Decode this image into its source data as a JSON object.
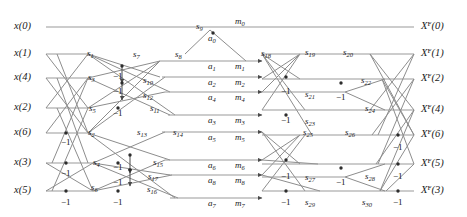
{
  "figure": {
    "type": "signal-flow-graph",
    "colors": {
      "line": "#8a8a8a",
      "text": "#1a1a1a",
      "background": "#ffffff"
    }
  },
  "inputs": [
    {
      "id": "x0",
      "text": "x(0)",
      "base": "x",
      "index": "(0)",
      "y": 27
    },
    {
      "id": "x1",
      "text": "x(1)",
      "base": "x",
      "index": "(1)",
      "y": 54
    },
    {
      "id": "x4",
      "text": "x(4)",
      "base": "x",
      "index": "(4)",
      "y": 78
    },
    {
      "id": "x2",
      "text": "x(2)",
      "base": "x",
      "index": "(2)",
      "y": 108
    },
    {
      "id": "x6",
      "text": "x(6)",
      "base": "x",
      "index": "(6)",
      "y": 133
    },
    {
      "id": "x3",
      "text": "x(3)",
      "base": "x",
      "index": "(3)",
      "y": 163
    },
    {
      "id": "x5",
      "text": "x(5)",
      "base": "x",
      "index": "(5)",
      "y": 191
    }
  ],
  "outputs": [
    {
      "id": "XF0",
      "base": "X",
      "sup": "F",
      "index": "(0)",
      "y": 27
    },
    {
      "id": "XF1",
      "base": "X",
      "sup": "F",
      "index": "(1)",
      "y": 54
    },
    {
      "id": "XF2",
      "base": "X",
      "sup": "F",
      "index": "(2)",
      "y": 79
    },
    {
      "id": "XF4",
      "base": "X",
      "sup": "F",
      "index": "(4)",
      "y": 110
    },
    {
      "id": "XF6",
      "base": "X",
      "sup": "F",
      "index": "(6)",
      "y": 135
    },
    {
      "id": "XF5",
      "base": "X",
      "sup": "F",
      "index": "(5)",
      "y": 164
    },
    {
      "id": "XF3",
      "base": "X",
      "sup": "F",
      "index": "(3)",
      "y": 191
    }
  ],
  "adder_nodes": [
    {
      "id": "a0",
      "base": "a",
      "sub": "0",
      "x": 213,
      "y": 33
    },
    {
      "id": "a1",
      "base": "a",
      "sub": "1",
      "x": 213,
      "y": 61
    },
    {
      "id": "a2",
      "base": "a",
      "sub": "2",
      "x": 213,
      "y": 77
    },
    {
      "id": "a4",
      "base": "a",
      "sub": "4",
      "x": 213,
      "y": 92
    },
    {
      "id": "a3",
      "base": "a",
      "sub": "3",
      "x": 213,
      "y": 115
    },
    {
      "id": "a5",
      "base": "a",
      "sub": "5",
      "x": 213,
      "y": 132
    },
    {
      "id": "a6",
      "base": "a",
      "sub": "6",
      "x": 213,
      "y": 160
    },
    {
      "id": "a8",
      "base": "a",
      "sub": "8",
      "x": 213,
      "y": 175
    },
    {
      "id": "a7",
      "base": "a",
      "sub": "7",
      "x": 213,
      "y": 198
    }
  ],
  "multiplier_nodes": [
    {
      "id": "m0",
      "base": "m",
      "sub": "0",
      "x": 239,
      "y": 22
    },
    {
      "id": "m1",
      "base": "m",
      "sub": "1",
      "x": 239,
      "y": 61
    },
    {
      "id": "m2",
      "base": "m",
      "sub": "2",
      "x": 239,
      "y": 77
    },
    {
      "id": "m4",
      "base": "m",
      "sub": "4",
      "x": 239,
      "y": 92
    },
    {
      "id": "m3",
      "base": "m",
      "sub": "3",
      "x": 239,
      "y": 115
    },
    {
      "id": "m5",
      "base": "m",
      "sub": "5",
      "x": 239,
      "y": 132
    },
    {
      "id": "m6",
      "base": "m",
      "sub": "6",
      "x": 239,
      "y": 160
    },
    {
      "id": "m8",
      "base": "m",
      "sub": "8",
      "x": 239,
      "y": 175
    },
    {
      "id": "m7",
      "base": "m",
      "sub": "7",
      "x": 239,
      "y": 198
    }
  ],
  "signal_labels": [
    {
      "id": "s0",
      "base": "s",
      "sub": "0",
      "x": 196,
      "y": 22
    },
    {
      "id": "s1",
      "base": "s",
      "sub": "1",
      "x": 87,
      "y": 49
    },
    {
      "id": "s2",
      "base": "s",
      "sub": "2",
      "x": 88,
      "y": 128
    },
    {
      "id": "s3",
      "base": "s",
      "sub": "3",
      "x": 88,
      "y": 73
    },
    {
      "id": "s4",
      "base": "s",
      "sub": "4",
      "x": 93,
      "y": 158
    },
    {
      "id": "s5",
      "base": "s",
      "sub": "5",
      "x": 89,
      "y": 104
    },
    {
      "id": "s6",
      "base": "s",
      "sub": "6",
      "x": 91,
      "y": 183
    },
    {
      "id": "s7",
      "base": "s",
      "sub": "7",
      "x": 133,
      "y": 50
    },
    {
      "id": "s8",
      "base": "s",
      "sub": "8",
      "x": 175,
      "y": 50
    },
    {
      "id": "s9",
      "base": "s",
      "sub": "9",
      "x": 196,
      "y": 22
    },
    {
      "id": "s10",
      "base": "s",
      "sub": "10",
      "x": 143,
      "y": 76
    },
    {
      "id": "s11",
      "base": "s",
      "sub": "11",
      "x": 150,
      "y": 104
    },
    {
      "id": "s12",
      "base": "s",
      "sub": "12",
      "x": 143,
      "y": 91
    },
    {
      "id": "s13",
      "base": "s",
      "sub": "13",
      "x": 137,
      "y": 128
    },
    {
      "id": "s14",
      "base": "s",
      "sub": "14",
      "x": 173,
      "y": 128
    },
    {
      "id": "s15",
      "base": "s",
      "sub": "15",
      "x": 153,
      "y": 158
    },
    {
      "id": "s16",
      "base": "s",
      "sub": "16",
      "x": 147,
      "y": 185
    },
    {
      "id": "s17",
      "base": "s",
      "sub": "17",
      "x": 148,
      "y": 172
    },
    {
      "id": "s18",
      "base": "s",
      "sub": "18",
      "x": 261,
      "y": 49
    },
    {
      "id": "s19",
      "base": "s",
      "sub": "19",
      "x": 305,
      "y": 48
    },
    {
      "id": "s20",
      "base": "s",
      "sub": "20",
      "x": 343,
      "y": 48
    },
    {
      "id": "s21",
      "base": "s",
      "sub": "21",
      "x": 305,
      "y": 90
    },
    {
      "id": "s22",
      "base": "s",
      "sub": "22",
      "x": 361,
      "y": 76
    },
    {
      "id": "s23",
      "base": "s",
      "sub": "23",
      "x": 305,
      "y": 117
    },
    {
      "id": "s24",
      "base": "s",
      "sub": "24",
      "x": 365,
      "y": 104
    },
    {
      "id": "s25",
      "base": "s",
      "sub": "25",
      "x": 303,
      "y": 128
    },
    {
      "id": "s26",
      "base": "s",
      "sub": "26",
      "x": 345,
      "y": 128
    },
    {
      "id": "s27",
      "base": "s",
      "sub": "27",
      "x": 305,
      "y": 173
    },
    {
      "id": "s28",
      "base": "s",
      "sub": "28",
      "x": 365,
      "y": 172
    },
    {
      "id": "s29",
      "base": "s",
      "sub": "29",
      "x": 305,
      "y": 198
    },
    {
      "id": "s30",
      "base": "s",
      "sub": "30",
      "x": 362,
      "y": 198
    }
  ],
  "weight_labels": [
    {
      "id": "w-l1",
      "text": "−1",
      "x": 113,
      "y": 71
    },
    {
      "id": "w-l2",
      "text": "−1",
      "x": 113,
      "y": 86
    },
    {
      "id": "w-l3",
      "text": "−1",
      "x": 61,
      "y": 137
    },
    {
      "id": "w-l4",
      "text": "−1",
      "x": 113,
      "y": 108
    },
    {
      "id": "w-l5",
      "text": "−1",
      "x": 61,
      "y": 168
    },
    {
      "id": "w-l6",
      "text": "−1",
      "x": 113,
      "y": 162
    },
    {
      "id": "w-l7",
      "text": "−1",
      "x": 113,
      "y": 177
    },
    {
      "id": "w-l8",
      "text": "−1",
      "x": 61,
      "y": 197
    },
    {
      "id": "w-l9",
      "text": "−1",
      "x": 113,
      "y": 197
    },
    {
      "id": "w-r1",
      "text": "−1",
      "x": 281,
      "y": 86
    },
    {
      "id": "w-r2",
      "text": "−1",
      "x": 281,
      "y": 115
    },
    {
      "id": "w-r3",
      "text": "−1",
      "x": 281,
      "y": 171
    },
    {
      "id": "w-r4",
      "text": "−1",
      "x": 281,
      "y": 197
    },
    {
      "id": "w-r5",
      "text": "−1",
      "x": 336,
      "y": 92
    },
    {
      "id": "w-r6",
      "text": "−1",
      "x": 336,
      "y": 177
    },
    {
      "id": "w-r7",
      "text": "−1",
      "x": 393,
      "y": 142
    },
    {
      "id": "w-r8",
      "text": "−1",
      "x": 393,
      "y": 171
    },
    {
      "id": "w-r9",
      "text": "−1",
      "x": 393,
      "y": 197
    }
  ]
}
